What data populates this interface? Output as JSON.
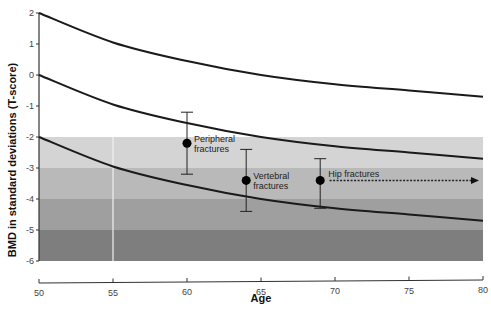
{
  "chart_data": {
    "type": "line",
    "title": "",
    "xlabel": "Age",
    "ylabel": "BMD in standard deviations (T-score)",
    "xlim": [
      50,
      80
    ],
    "ylim": [
      -6,
      2
    ],
    "xticks": [
      50,
      55,
      60,
      65,
      70,
      75,
      80
    ],
    "yticks": [
      2,
      1,
      0,
      -1,
      -2,
      -3,
      -4,
      -5,
      -6
    ],
    "grid": false,
    "bands": [
      {
        "from": -2,
        "to": -3,
        "color": "#d4d4d4"
      },
      {
        "from": -3,
        "to": -4,
        "color": "#b9b9b9"
      },
      {
        "from": -4,
        "to": -5,
        "color": "#9f9f9f"
      },
      {
        "from": -5,
        "to": -6,
        "color": "#7e7e7e"
      }
    ],
    "x": [
      50,
      55,
      60,
      65,
      70,
      75,
      80
    ],
    "series": [
      {
        "name": "upper curve",
        "values": [
          2.0,
          1.05,
          0.45,
          0.0,
          -0.3,
          -0.5,
          -0.7
        ]
      },
      {
        "name": "middle curve",
        "values": [
          0.0,
          -0.95,
          -1.55,
          -2.0,
          -2.3,
          -2.5,
          -2.7
        ]
      },
      {
        "name": "lower curve",
        "values": [
          -2.0,
          -2.95,
          -3.55,
          -4.0,
          -4.3,
          -4.5,
          -4.7
        ]
      }
    ],
    "error_points": [
      {
        "label_line1": "Peripheral",
        "label_line2": "fractures",
        "age": 60,
        "mean": -2.2,
        "low": -3.2,
        "high": -1.2
      },
      {
        "label_line1": "Vertebral",
        "label_line2": "fractures",
        "age": 64,
        "mean": -3.4,
        "low": -4.4,
        "high": -2.4
      },
      {
        "label_line1": "Hip fractures",
        "label_line2": "",
        "age": 69,
        "mean": -3.4,
        "low": -4.3,
        "high": -2.7
      }
    ],
    "annotations": [
      {
        "type": "dotted-arrow",
        "from_age": 69.5,
        "to_age": 80,
        "value": -3.4
      }
    ]
  }
}
